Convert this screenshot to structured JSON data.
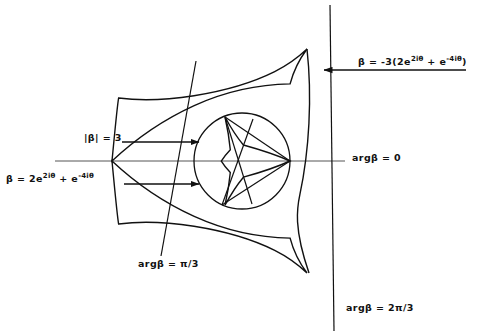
{
  "figure": {
    "kind": "deltoid-hypocycloid-diagram",
    "background": "#ffffff",
    "stroke_color": "#111111",
    "axis_color": "#555555",
    "width": 491,
    "height": 332
  },
  "labels": {
    "beta_negative": {
      "text": "β = -3(2e",
      "sup1": "2iθ",
      "mid": " + e",
      "sup2": "-4iθ",
      "tail": ")"
    },
    "beta_positive": {
      "text": "β = 2e",
      "sup1": "2iθ",
      "mid": " + e",
      "sup2": "-4iθ",
      "tail": ""
    },
    "abs_beta": "|β| = 3",
    "arg_zero": "argβ = 0",
    "arg_pi_over_3": "argβ = π/3",
    "arg_2pi_over_3": "argβ = 2π/3"
  },
  "geometry": {
    "center": {
      "x": 242,
      "y": 161
    },
    "circle_radius": 48,
    "inner_deltoid_scale": 16,
    "outer_deltoid_scale": 48,
    "cusps_outer": [
      {
        "x": 112,
        "y": 161
      },
      {
        "x": 307,
        "y": 49
      },
      {
        "x": 309,
        "y": 273
      }
    ],
    "cusps_inner": [
      {
        "x": 290,
        "y": 161
      },
      {
        "x": 225,
        "y": 117
      },
      {
        "x": 222,
        "y": 205
      }
    ],
    "axis_line": {
      "x1": 55,
      "y1": 161,
      "x2": 345,
      "y2": 161
    },
    "ray_pi_over_3": {
      "x1": 195,
      "y1": 62,
      "x2": 162,
      "y2": 253
    },
    "ray_2pi_over_3": {
      "x1": 330,
      "y1": 6,
      "x2": 333,
      "y2": 330
    }
  },
  "arrows": [
    {
      "name": "arrow-beta-negative",
      "x1": 466,
      "y1": 70,
      "x2": 323,
      "y2": 70
    },
    {
      "name": "arrow-abs-beta",
      "x1": 122,
      "y1": 142,
      "x2": 200,
      "y2": 142
    },
    {
      "name": "arrow-beta-positive",
      "x1": 124,
      "y1": 184,
      "x2": 200,
      "y2": 184
    }
  ]
}
